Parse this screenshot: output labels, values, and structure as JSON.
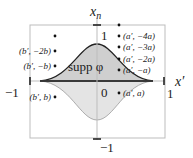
{
  "axes": {
    "x_label": "x′",
    "y_label": "x",
    "y_label_sub": "n",
    "tick_x_neg": "−1",
    "tick_x_pos": "1",
    "tick_y_pos": "1",
    "tick_y_neg": "−1",
    "origin": "0"
  },
  "region": {
    "label": "supp φ",
    "upper_fill": "#cfcfcf",
    "lower_fill": "#e4e4e4",
    "outline_color": "#222222",
    "lower_outline_color": "#9a9a9a"
  },
  "box": {
    "color": "#bdbdbd"
  },
  "points_left": [
    {
      "label": "",
      "y": 36
    },
    {
      "label": "(b′, −2b)",
      "y": 51
    },
    {
      "label": "(b′, −b)",
      "y": 66
    },
    {
      "label": "(b′, b)",
      "y": 97
    }
  ],
  "points_right": [
    {
      "label": "",
      "y": 25
    },
    {
      "label": "(a′, −4a)",
      "y": 36
    },
    {
      "label": "(a′, −3a)",
      "y": 47
    },
    {
      "label": "(a′, −2a)",
      "y": 59
    },
    {
      "label": "(a′, −a)",
      "y": 70
    },
    {
      "label": "(a′, a)",
      "y": 93
    }
  ]
}
